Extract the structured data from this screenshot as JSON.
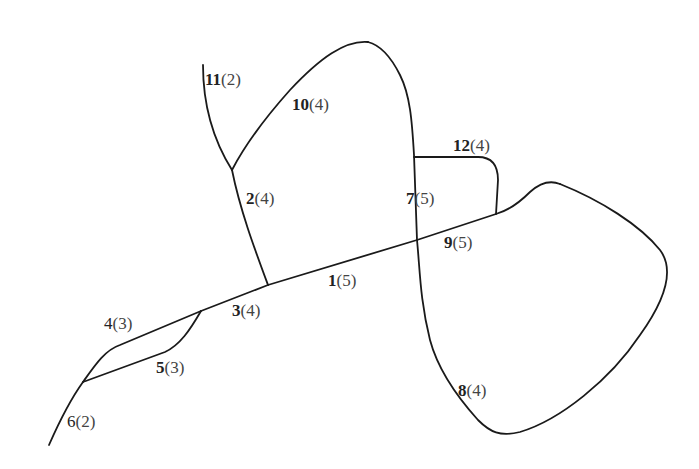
{
  "diagram": {
    "type": "road-network-graph",
    "edges": [
      {
        "id": "1",
        "weight": "(5)",
        "bold": true
      },
      {
        "id": "2",
        "weight": "(4)",
        "bold": true
      },
      {
        "id": "3",
        "weight": "(4)",
        "bold": true
      },
      {
        "id": "4",
        "weight": "(3)",
        "bold": false
      },
      {
        "id": "5",
        "weight": "(3)",
        "bold": true
      },
      {
        "id": "6",
        "weight": "(2)",
        "bold": false
      },
      {
        "id": "7",
        "weight": "(5)",
        "bold": true
      },
      {
        "id": "8",
        "weight": "(4)",
        "bold": true
      },
      {
        "id": "9",
        "weight": "(5)",
        "bold": true
      },
      {
        "id": "10",
        "weight": "(4)",
        "bold": true
      },
      {
        "id": "11",
        "weight": "(2)",
        "bold": true
      },
      {
        "id": "12",
        "weight": "(4)",
        "bold": true
      }
    ],
    "stroke_color": "#1a1a1a",
    "background": "#ffffff"
  }
}
